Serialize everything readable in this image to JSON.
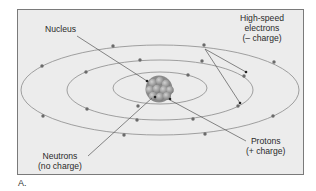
{
  "figure": {
    "caption": "A.",
    "colors": {
      "panel_bg": "#ececec",
      "panel_border": "#7a7a7a",
      "orbit": "#8a8a8a",
      "electron": "#6a6a6a",
      "nucleus": "#9a9a9a",
      "leader_line": "#555555"
    }
  },
  "labels": {
    "nucleus": "Nucleus",
    "electrons_line1": "High-speed",
    "electrons_line2": "electrons",
    "electrons_line3": "(– charge)",
    "neutrons_line1": "Neutrons",
    "neutrons_line2": "(no charge)",
    "protons_line1": "Protons",
    "protons_line2": "(+ charge)"
  },
  "orbits": [
    {
      "name": "inner",
      "cx": 160,
      "cy": 88,
      "rx": 47,
      "ry": 16
    },
    {
      "name": "middle",
      "cx": 160,
      "cy": 90,
      "rx": 93,
      "ry": 30
    },
    {
      "name": "outer",
      "cx": 160,
      "cy": 90,
      "rx": 139,
      "ry": 45
    }
  ]
}
